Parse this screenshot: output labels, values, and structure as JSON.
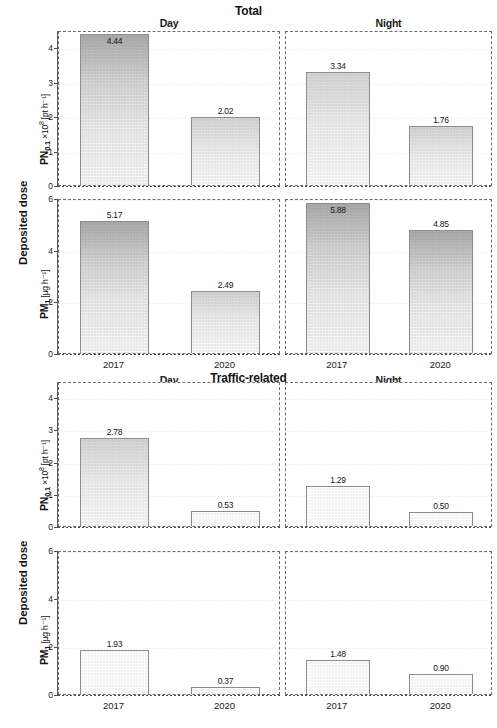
{
  "figure": {
    "outer_ylabel_top": "Deposited dose",
    "outer_ylabel_bottom": "Deposited dose"
  },
  "groups": [
    {
      "id": "total",
      "title": "Total",
      "columns": [
        "Day",
        "Night"
      ]
    },
    {
      "id": "traffic",
      "title": "Traffic-related",
      "columns": [
        "Day",
        "Night"
      ]
    }
  ],
  "axes": {
    "pn_label_main": "PN",
    "pn_label_sub": "0.1",
    "pn_label_rest": " ×10",
    "pn_label_exp": "8",
    "pn_label_unit": " [pt h⁻¹]",
    "pm_label_main": "PM",
    "pm_label_sub": "1",
    "pm_label_unit": " [µg h⁻¹]",
    "pn_ticks": [
      "0",
      "1",
      "2",
      "3",
      "4"
    ],
    "pm_ticks": [
      "0",
      "2",
      "4",
      "6"
    ],
    "pn_ylim": [
      0,
      4.5
    ],
    "pm_ylim": [
      0,
      6
    ],
    "categories": [
      "2017",
      "2020"
    ]
  },
  "chart_data": {
    "type": "bar",
    "xlabel": "",
    "ylabel": "Deposited dose",
    "grid": true,
    "legend": "none",
    "categories": [
      "2017",
      "2020"
    ],
    "panels": [
      {
        "group": "Total",
        "column": "Day",
        "metric": "PN0.1 ×10^8",
        "ylabel": "PN0.1 ×10⁸ [pt h⁻¹]",
        "ylim": [
          0,
          4.5
        ],
        "yticks": [
          0,
          1,
          2,
          3,
          4
        ],
        "categories": [
          "2017",
          "2020"
        ],
        "values": [
          4.44,
          2.02
        ],
        "labels": [
          "4.44",
          "2.02"
        ]
      },
      {
        "group": "Total",
        "column": "Night",
        "metric": "PN0.1 ×10^8",
        "ylabel": "PN0.1 ×10⁸ [pt h⁻¹]",
        "ylim": [
          0,
          4.5
        ],
        "yticks": [
          0,
          1,
          2,
          3,
          4
        ],
        "categories": [
          "2017",
          "2020"
        ],
        "values": [
          3.34,
          1.76
        ],
        "labels": [
          "3.34",
          "1.76"
        ]
      },
      {
        "group": "Total",
        "column": "Day",
        "metric": "PM1",
        "ylabel": "PM1 [µg h⁻¹]",
        "ylim": [
          0,
          6
        ],
        "yticks": [
          0,
          2,
          4,
          6
        ],
        "categories": [
          "2017",
          "2020"
        ],
        "values": [
          5.17,
          2.49
        ],
        "labels": [
          "5.17",
          "2.49"
        ]
      },
      {
        "group": "Total",
        "column": "Night",
        "metric": "PM1",
        "ylabel": "PM1 [µg h⁻¹]",
        "ylim": [
          0,
          6
        ],
        "yticks": [
          0,
          2,
          4,
          6
        ],
        "categories": [
          "2017",
          "2020"
        ],
        "values": [
          5.88,
          4.85
        ],
        "labels": [
          "5.88",
          "4.85"
        ]
      },
      {
        "group": "Traffic-related",
        "column": "Day",
        "metric": "PN0.1 ×10^8",
        "ylabel": "PN0.1 ×10⁸ [pt h⁻¹]",
        "ylim": [
          0,
          4.5
        ],
        "yticks": [
          0,
          1,
          2,
          3,
          4
        ],
        "categories": [
          "2017",
          "2020"
        ],
        "values": [
          2.78,
          0.53
        ],
        "labels": [
          "2.78",
          "0.53"
        ]
      },
      {
        "group": "Traffic-related",
        "column": "Night",
        "metric": "PN0.1 ×10^8",
        "ylabel": "PN0.1 ×10⁸ [pt h⁻¹]",
        "ylim": [
          0,
          4.5
        ],
        "yticks": [
          0,
          1,
          2,
          3,
          4
        ],
        "categories": [
          "2017",
          "2020"
        ],
        "values": [
          1.29,
          0.5
        ],
        "labels": [
          "1.29",
          "0.50"
        ]
      },
      {
        "group": "Traffic-related",
        "column": "Day",
        "metric": "PM1",
        "ylabel": "PM1 [µg h⁻¹]",
        "ylim": [
          0,
          6
        ],
        "yticks": [
          0,
          2,
          4,
          6
        ],
        "categories": [
          "2017",
          "2020"
        ],
        "values": [
          1.93,
          0.37
        ],
        "labels": [
          "1.93",
          "0.37"
        ]
      },
      {
        "group": "Traffic-related",
        "column": "Night",
        "metric": "PM1",
        "ylabel": "PM1 [µg h⁻¹]",
        "ylim": [
          0,
          6
        ],
        "yticks": [
          0,
          2,
          4,
          6
        ],
        "categories": [
          "2017",
          "2020"
        ],
        "values": [
          1.48,
          0.9
        ],
        "labels": [
          "1.48",
          "0.90"
        ]
      }
    ]
  }
}
